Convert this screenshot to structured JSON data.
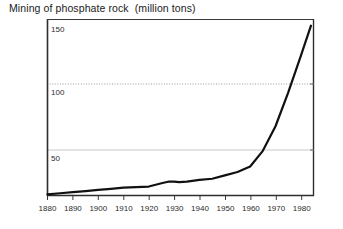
{
  "chart_data": {
    "type": "line",
    "title": "Mining of phosphate rock  (million tons)",
    "xlabel": "",
    "ylabel": "",
    "unit": "million tons",
    "grid": true,
    "legend": "none",
    "xlim": [
      1880,
      1985
    ],
    "ylim": [
      0,
      158
    ],
    "ytick_labels": [
      "50",
      "100",
      "150"
    ],
    "yticks": [
      50,
      100,
      150
    ],
    "xtick_labels": [
      "1880",
      "1890",
      "1900",
      "1910",
      "1920",
      "1930",
      "1940",
      "1950",
      "1960",
      "1970",
      "1980"
    ],
    "xticks": [
      1880,
      1890,
      1900,
      1910,
      1920,
      1930,
      1940,
      1950,
      1960,
      1970,
      1980
    ],
    "series": [
      {
        "name": "Mining of phosphate rock",
        "x": [
          1880,
          1885,
          1890,
          1895,
          1900,
          1905,
          1910,
          1915,
          1920,
          1925,
          1928,
          1930,
          1932,
          1935,
          1940,
          1945,
          1950,
          1955,
          1960,
          1965,
          1970,
          1975,
          1980,
          1984
        ],
        "values": [
          1,
          2,
          3,
          4,
          5,
          6,
          7,
          7.5,
          8,
          11,
          12.5,
          12.5,
          12,
          12.5,
          14,
          15,
          18,
          21,
          26,
          40,
          62,
          92,
          125,
          152
        ]
      }
    ],
    "colors": {
      "line": "#111111",
      "axis": "#333333",
      "grid_major": "#9a9a9a",
      "grid_minor": "#c8c8c8",
      "background": "#ffffff",
      "text": "#1a1a1a"
    }
  }
}
